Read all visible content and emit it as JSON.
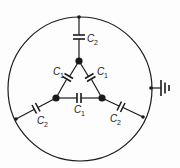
{
  "diagram": {
    "title": "",
    "labels": {
      "c2_top": {
        "main": "C",
        "sub": "2"
      },
      "c1_left": {
        "main": "C",
        "sub": "1"
      },
      "c1_right": {
        "main": "C",
        "sub": "1"
      },
      "c1_bottom": {
        "main": "C",
        "sub": "1"
      },
      "c2_left": {
        "main": "C",
        "sub": "2"
      },
      "c2_right": {
        "main": "C",
        "sub": "2"
      }
    },
    "components": [
      {
        "id": "c2-top",
        "type": "capacitor",
        "label": "C2",
        "connects": [
          "inner-node-top",
          "outer-node-top"
        ]
      },
      {
        "id": "c2-left",
        "type": "capacitor",
        "label": "C2",
        "connects": [
          "inner-node-left",
          "outer-node-left"
        ]
      },
      {
        "id": "c2-right",
        "type": "capacitor",
        "label": "C2",
        "connects": [
          "inner-node-right",
          "outer-node-right"
        ]
      },
      {
        "id": "c1-left",
        "type": "capacitor",
        "label": "C1",
        "connects": [
          "inner-node-top",
          "inner-node-left"
        ]
      },
      {
        "id": "c1-right",
        "type": "capacitor",
        "label": "C1",
        "connects": [
          "inner-node-top",
          "inner-node-right"
        ]
      },
      {
        "id": "c1-bottom",
        "type": "capacitor",
        "label": "C1",
        "connects": [
          "inner-node-left",
          "inner-node-right"
        ]
      },
      {
        "id": "ground",
        "type": "ground",
        "connects": [
          "outer-node-ground"
        ]
      }
    ],
    "colors": {
      "ink": "#1a1a1a",
      "background": "#fdfdfd"
    }
  }
}
